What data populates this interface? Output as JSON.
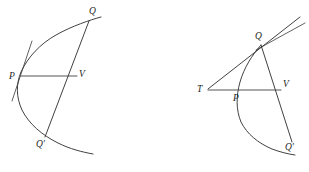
{
  "figure": {
    "title": "",
    "background_color": "#ffffff",
    "stroke_color": "#2b2b2b",
    "chord_color": "#555555",
    "panels": [
      {
        "id": "left",
        "name": "parabola-with-tangent-at-p",
        "labels": [
          {
            "text": "Q",
            "x": 89,
            "y": 14
          },
          {
            "text": "P",
            "x": 9,
            "y": 79
          },
          {
            "text": "V",
            "x": 79,
            "y": 77
          },
          {
            "text": "Q'",
            "x": 36,
            "y": 147
          }
        ],
        "points": {
          "Q": {
            "x": 88,
            "y": 22
          },
          "P": {
            "x": 21,
            "y": 75
          },
          "V": {
            "x": 76,
            "y": 75
          },
          "Qp": {
            "x": 47,
            "y": 136
          }
        }
      },
      {
        "id": "right",
        "name": "parabola-with-tangent-from-t",
        "labels": [
          {
            "text": "Q",
            "x": 255,
            "y": 39
          },
          {
            "text": "T",
            "x": 200,
            "y": 92
          },
          {
            "text": "P",
            "x": 233,
            "y": 101
          },
          {
            "text": "V",
            "x": 283,
            "y": 87
          },
          {
            "text": "Q'",
            "x": 285,
            "y": 150
          }
        ],
        "points": {
          "Q": {
            "x": 261,
            "y": 46
          },
          "T": {
            "x": 209,
            "y": 89
          },
          "P": {
            "x": 239,
            "y": 92
          },
          "V": {
            "x": 279,
            "y": 92
          },
          "Qp": {
            "x": 290,
            "y": 141
          }
        }
      }
    ]
  }
}
